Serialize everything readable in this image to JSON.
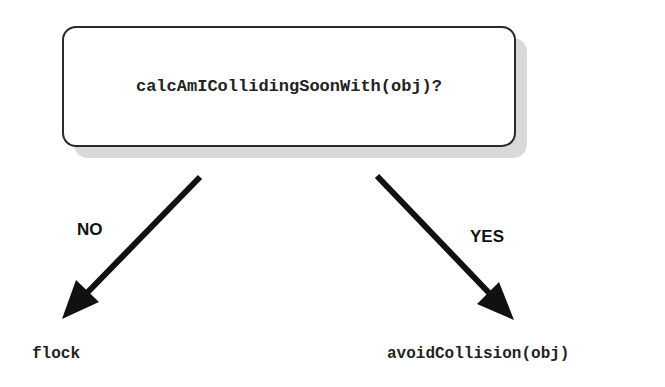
{
  "diagram": {
    "decision": {
      "text": "calcAmICollidingSoonWith(obj)?"
    },
    "branches": [
      {
        "label": "NO",
        "outcome": "flock"
      },
      {
        "label": "YES",
        "outcome": "avoidCollision(obj)"
      }
    ],
    "colors": {
      "stroke": "#111111",
      "shadow": "#d9d9d9",
      "background": "#ffffff"
    }
  }
}
